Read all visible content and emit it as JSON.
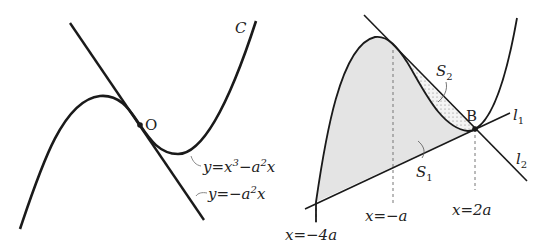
{
  "left_figure": {
    "curve_label": "C",
    "origin_label": "O",
    "curve_equation": {
      "base": "y=x",
      "exp": "3",
      "rest": "−a",
      "exp2": "2",
      "tail": "x"
    },
    "tangent_equation": {
      "base": "y=−a",
      "exp": "2",
      "tail": "x"
    }
  },
  "right_figure": {
    "point_label": "B",
    "line1_label": {
      "base": "l",
      "sub": "1"
    },
    "line2_label": {
      "base": "l",
      "sub": "2"
    },
    "region1_label": {
      "base": "S",
      "sub": "1"
    },
    "region2_label": {
      "base": "S",
      "sub": "2"
    },
    "x_marks": [
      "x=−4a",
      "x=−a",
      "x=2a"
    ]
  },
  "colors": {
    "stroke": "#1a1a1a",
    "fill_region1": "#e4e4e4",
    "fill_region2": "#f2f2f2",
    "dash": "#777777"
  }
}
